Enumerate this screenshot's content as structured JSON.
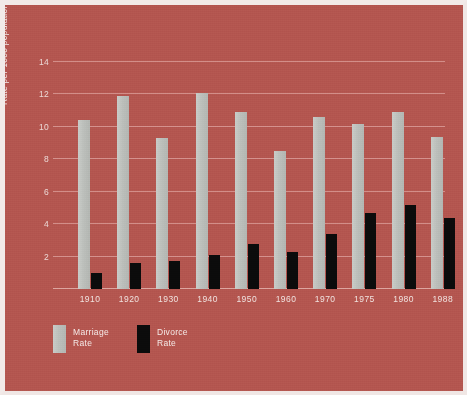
{
  "chart_data": {
    "type": "bar",
    "title": "",
    "subtitle": "",
    "xlabel": "",
    "ylabel": "Rate per 1000 population",
    "categories": [
      "1910",
      "1920",
      "1930",
      "1940",
      "1950",
      "1960",
      "1970",
      "1975",
      "1980",
      "1988"
    ],
    "series": [
      {
        "name": "Marriage Rate",
        "color": "#bec1bd",
        "values": [
          10.4,
          11.9,
          9.3,
          12.1,
          10.9,
          8.5,
          10.6,
          10.2,
          10.9,
          9.4
        ]
      },
      {
        "name": "Divorce Rate",
        "color": "#0b0b0b",
        "values": [
          1.0,
          1.6,
          1.7,
          2.1,
          2.8,
          2.3,
          3.4,
          4.7,
          5.2,
          4.4
        ]
      }
    ],
    "ylim": [
      0,
      14
    ],
    "yticks": [
      2,
      4,
      6,
      8,
      10,
      12,
      14
    ],
    "ytick_labels": [
      "2",
      "4",
      "6",
      "8",
      "10",
      "12",
      "14"
    ],
    "grid": "horizontal",
    "legend_position": "bottom-left",
    "background_color": "#b4564f",
    "gridline_color": "#d4908b",
    "text_color": "#f1e3e0"
  },
  "legend": {
    "items": [
      {
        "label": "Marriage\nRate",
        "swatch": "marriage-swatch"
      },
      {
        "label": "Divorce\nRate",
        "swatch": "divorce-swatch"
      }
    ]
  }
}
